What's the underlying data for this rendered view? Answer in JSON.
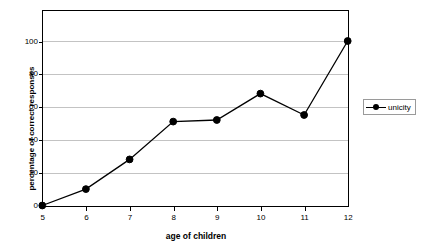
{
  "chart_data": {
    "type": "line",
    "title": "",
    "xlabel": "age of children",
    "ylabel": "percentage of correct responses",
    "categories": [
      5,
      6,
      7,
      8,
      9,
      10,
      11,
      12
    ],
    "x": [
      5,
      6,
      7,
      8,
      9,
      10,
      11,
      12
    ],
    "xticklabels": [
      "5",
      "6",
      "7",
      "8",
      "9",
      "10",
      "11",
      "12"
    ],
    "yticklabels": [
      "0",
      "20",
      "40",
      "60",
      "80",
      "100"
    ],
    "yticks": [
      0,
      20,
      40,
      60,
      80,
      100
    ],
    "xlim": [
      5,
      12
    ],
    "ylim": [
      0,
      120
    ],
    "grid": "horizontal",
    "legend_position": "right",
    "series": [
      {
        "name": "unicity",
        "color": "#000000",
        "marker": "filled-circle",
        "values": [
          0,
          10,
          28,
          51,
          52,
          68,
          55,
          100
        ]
      }
    ]
  },
  "legend": {
    "entries": [
      {
        "label": "unicity"
      }
    ]
  },
  "colors": {
    "line": "#000000",
    "marker": "#000000",
    "gridline": "#c3c3c3",
    "frame": "#000000",
    "background": "#ffffff",
    "legend_border": "#9a9a9a"
  }
}
